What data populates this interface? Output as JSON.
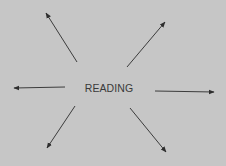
{
  "diagram": {
    "center_label": "READING",
    "background": "#c6c6c6",
    "line_color": "#3c3c3c",
    "arrows": [
      {
        "name": "arrow-northwest",
        "x1": 77,
        "y1": 62,
        "x2": 46,
        "y2": 13
      },
      {
        "name": "arrow-northeast",
        "x1": 127,
        "y1": 67,
        "x2": 165,
        "y2": 22
      },
      {
        "name": "arrow-west",
        "x1": 65,
        "y1": 87,
        "x2": 14,
        "y2": 88
      },
      {
        "name": "arrow-east",
        "x1": 155,
        "y1": 91,
        "x2": 214,
        "y2": 92
      },
      {
        "name": "arrow-southwest",
        "x1": 75,
        "y1": 106,
        "x2": 47,
        "y2": 148
      },
      {
        "name": "arrow-southeast",
        "x1": 130,
        "y1": 108,
        "x2": 166,
        "y2": 152
      }
    ]
  }
}
